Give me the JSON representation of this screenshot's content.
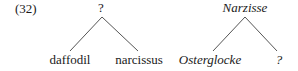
{
  "example": {
    "number": "(32)"
  },
  "trees": [
    {
      "language": "English",
      "root": {
        "label": "?",
        "italic": false
      },
      "children": [
        {
          "label": "daffodil",
          "italic": false
        },
        {
          "label": "narcissus",
          "italic": false
        }
      ]
    },
    {
      "language": "German",
      "root": {
        "label": "Narzisse",
        "italic": true
      },
      "children": [
        {
          "label": "Osterglocke",
          "italic": true
        },
        {
          "label": "?",
          "italic": true
        }
      ]
    }
  ],
  "colors": {
    "text": "#1a1a1a",
    "edge": "#555555",
    "background": "#ffffff"
  }
}
